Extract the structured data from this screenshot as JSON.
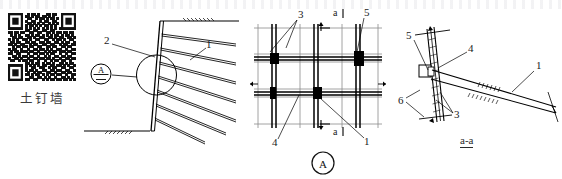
{
  "drawing": {
    "title_cjk": "土钉墙",
    "title_pinyin_meaning": "soil nail wall",
    "views": [
      {
        "id": "section-view",
        "name": "cross-section"
      },
      {
        "id": "plan-view",
        "name": "detail A mesh plan",
        "tag": "A"
      },
      {
        "id": "aa-section-view",
        "name": "section a-a",
        "tag": "a-a"
      }
    ]
  },
  "left_view": {
    "callouts": [
      {
        "text": "2",
        "x": 106,
        "y": 40
      },
      {
        "text": "1",
        "x": 208,
        "y": 44
      }
    ],
    "detail_bubble": "A"
  },
  "middle_view": {
    "callouts": [
      {
        "text": "3",
        "x": 300,
        "y": 15
      },
      {
        "text": "5",
        "x": 366,
        "y": 13
      },
      {
        "text": "4",
        "x": 272,
        "y": 142
      },
      {
        "text": "1",
        "x": 366,
        "y": 142
      }
    ],
    "section_marks": [
      {
        "text": "a",
        "x": 333,
        "y": 13
      },
      {
        "text": "a",
        "x": 333,
        "y": 130
      }
    ],
    "view_tag": "A"
  },
  "right_view": {
    "callouts": [
      {
        "text": "5",
        "x": 409,
        "y": 35
      },
      {
        "text": "4",
        "x": 470,
        "y": 48
      },
      {
        "text": "1",
        "x": 536,
        "y": 66
      },
      {
        "text": "6",
        "x": 401,
        "y": 101
      },
      {
        "text": "3",
        "x": 456,
        "y": 115
      }
    ],
    "view_tag": "a-a"
  },
  "colors": {
    "ink": "#1a1a1a",
    "line": "#000000",
    "grid_light": "#888888",
    "node_fill": "#000000",
    "paper": "#ffffff"
  },
  "qr": {
    "label": "qr-code",
    "modules": 29,
    "matrix": [
      "11111110010110100011011001111111",
      "10000010110101101101010001000001",
      "10111010011001011010110101011101",
      "10111010100110010110011001011101",
      "10111010011010101001010101011101",
      "10000010101101010110101001000001",
      "11111110101010101010101011111111",
      "00000000110011001100110000000000",
      "11011011001100110011010110110110",
      "01010100110101101010101101011010",
      "00110110011010011001101011001101",
      "10101001101001100110010110100110",
      "01101100110110011011001101011001",
      "11010011001011001100110010110011",
      "00101101101100110011011001101100",
      "10110010010011011010100110010011",
      "01011011101100100101011011101100",
      "11001100010011011010110010010011",
      "00110101101100100101001101101100",
      "10011010010011011011010010011011",
      "01100101101100100100101101100100",
      "00000000110101101011010011010110",
      "11111110101010101100110110101001",
      "10000010100110011001011001100110",
      "10111010101101001100110110011001",
      "10111010010010110011001001101100",
      "10111010110101101010110110010011",
      "10000010001100110101001001101010",
      "11111110110011001010110110110101"
    ]
  }
}
